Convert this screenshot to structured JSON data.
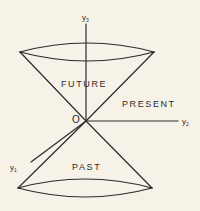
{
  "diagram": {
    "title": "",
    "type": "light-cone",
    "colors": {
      "background": "#f6f2e8",
      "stroke": "#2b2b2b"
    },
    "origin": {
      "label": "O",
      "x": 86,
      "y": 121
    },
    "axes": [
      {
        "id": "y3",
        "label": "y",
        "subscript": "3",
        "direction": "up"
      },
      {
        "id": "y2",
        "label": "y",
        "subscript": "2",
        "direction": "right"
      },
      {
        "id": "y1",
        "label": "y",
        "subscript": "1",
        "direction": "down-left"
      }
    ],
    "regions": {
      "future": "FUTURE",
      "present": "PRESENT",
      "past": "PAST"
    },
    "cones": {
      "upper": {
        "cx": 87,
        "cy": 52,
        "rx": 67,
        "ry": 9
      },
      "lower": {
        "cx": 85,
        "cy": 189,
        "rx": 67,
        "ry": 9
      }
    }
  }
}
